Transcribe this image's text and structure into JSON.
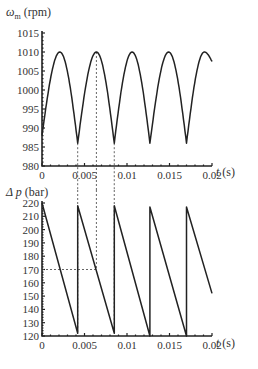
{
  "chart_data": [
    {
      "type": "line",
      "title": "",
      "ylabel": "ω_m (rpm)",
      "xlabel": "t (s)",
      "xlim": [
        0,
        0.02
      ],
      "ylim": [
        980,
        1015
      ],
      "xticks": [
        0,
        0.005,
        0.01,
        0.015,
        0.02
      ],
      "xtick_labels": [
        "0",
        "0.005",
        "0.01",
        "0.015",
        "0.02"
      ],
      "yticks": [
        980,
        985,
        990,
        995,
        1000,
        1005,
        1010,
        1015
      ],
      "ytick_labels": [
        "980",
        "985",
        "990",
        "995",
        "1000",
        "1005",
        "1010",
        "1015"
      ],
      "grid": false,
      "series": [
        {
          "name": "motor speed",
          "x": [
            0,
            0.0021,
            0.0042,
            0.0064,
            0.0085,
            0.0106,
            0.0127,
            0.0149,
            0.017,
            0.0191,
            0.02
          ],
          "values": [
            988,
            1010,
            986,
            1010,
            986,
            1010,
            986,
            1010,
            986,
            1010,
            1007.5
          ]
        }
      ],
      "annotations": [
        {
          "type": "vline-dashed",
          "x": 0.0042
        },
        {
          "type": "vline-dashed",
          "x": 0.0064
        },
        {
          "type": "vline-dashed",
          "x": 0.0085
        }
      ]
    },
    {
      "type": "line",
      "title": "",
      "ylabel": "Δ p (bar)",
      "xlabel": "t (s)",
      "xlim": [
        0,
        0.02
      ],
      "ylim": [
        120,
        220
      ],
      "xticks": [
        0,
        0.005,
        0.01,
        0.015,
        0.02
      ],
      "xtick_labels": [
        "0",
        "0.005",
        "0.01",
        "0.015",
        "0.02"
      ],
      "yticks": [
        120,
        130,
        140,
        150,
        160,
        170,
        180,
        190,
        200,
        210,
        220
      ],
      "ytick_labels": [
        "120",
        "130",
        "140",
        "150",
        "160",
        "170",
        "180",
        "190",
        "200",
        "210",
        "220"
      ],
      "grid": false,
      "series": [
        {
          "name": "pressure difference",
          "x": [
            0,
            0.0042,
            0.0042,
            0.0085,
            0.0085,
            0.0127,
            0.0127,
            0.017,
            0.017,
            0.02
          ],
          "values": [
            220,
            122,
            218,
            122,
            218,
            120,
            217,
            120,
            217,
            152
          ]
        }
      ],
      "annotations": [
        {
          "type": "vline-dashed",
          "x": 0.0042
        },
        {
          "type": "vline-dashed",
          "x": 0.0064
        },
        {
          "type": "vline-dashed",
          "x": 0.0085
        },
        {
          "type": "hline-dashed",
          "y": 170,
          "x_range": [
            0,
            0.0064
          ]
        }
      ]
    }
  ],
  "labels": {
    "top_ylabel_symbol": "ω",
    "top_ylabel_sub": "m",
    "top_ylabel_unit": " (rpm)",
    "bottom_ylabel_symbol": "Δ p",
    "bottom_ylabel_unit": " (bar)",
    "xlabel_var": "t",
    "xlabel_unit": " (s)"
  }
}
